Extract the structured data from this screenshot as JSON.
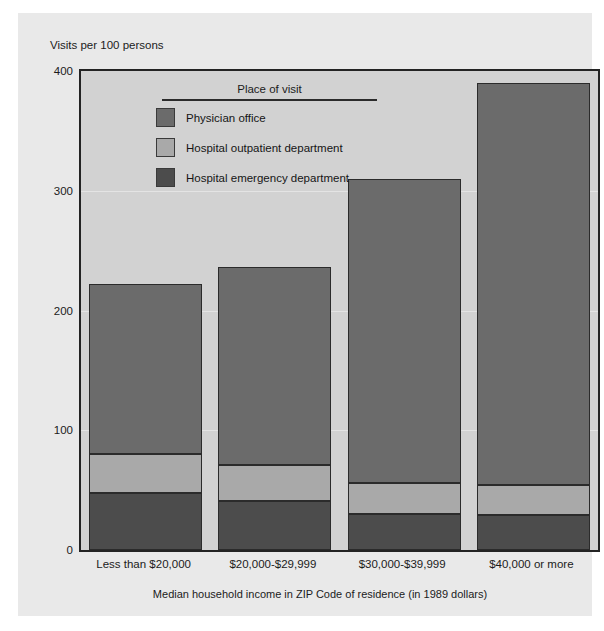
{
  "axes": {
    "y_title": "Visits per 100 persons",
    "y_ticks": [
      "400",
      "300",
      "200",
      "100",
      "0"
    ],
    "x_title": "Median household income in ZIP Code of residence (in 1989 dollars)"
  },
  "legend": {
    "title": "Place of visit",
    "items": [
      {
        "label": "Physician office",
        "color": "#6b6b6b"
      },
      {
        "label": "Hospital outpatient department",
        "color": "#a9a9a9"
      },
      {
        "label": "Hospital emergency department",
        "color": "#4c4c4c"
      }
    ]
  },
  "chart_data": {
    "type": "bar",
    "stacked": true,
    "title": "",
    "subtitle": "",
    "xlabel": "Median household income in ZIP Code of residence (in 1989 dollars)",
    "ylabel": "Visits per 100 persons",
    "ylim": [
      0,
      400
    ],
    "yticks": [
      0,
      100,
      200,
      300,
      400
    ],
    "grid": false,
    "legend_position": "inside-top-left",
    "categories": [
      "Less than $20,000",
      "$20,000-$29,999",
      "$30,000-$39,999",
      "$40,000 or more"
    ],
    "series": [
      {
        "name": "Hospital emergency department",
        "color": "#4c4c4c",
        "values": [
          48,
          41,
          30,
          29
        ]
      },
      {
        "name": "Hospital outpatient department",
        "color": "#a9a9a9",
        "values": [
          32,
          30,
          26,
          25
        ]
      },
      {
        "name": "Physician office",
        "color": "#6b6b6b",
        "values": [
          142,
          165,
          254,
          336
        ]
      }
    ],
    "totals": [
      222,
      236,
      310,
      390
    ]
  }
}
